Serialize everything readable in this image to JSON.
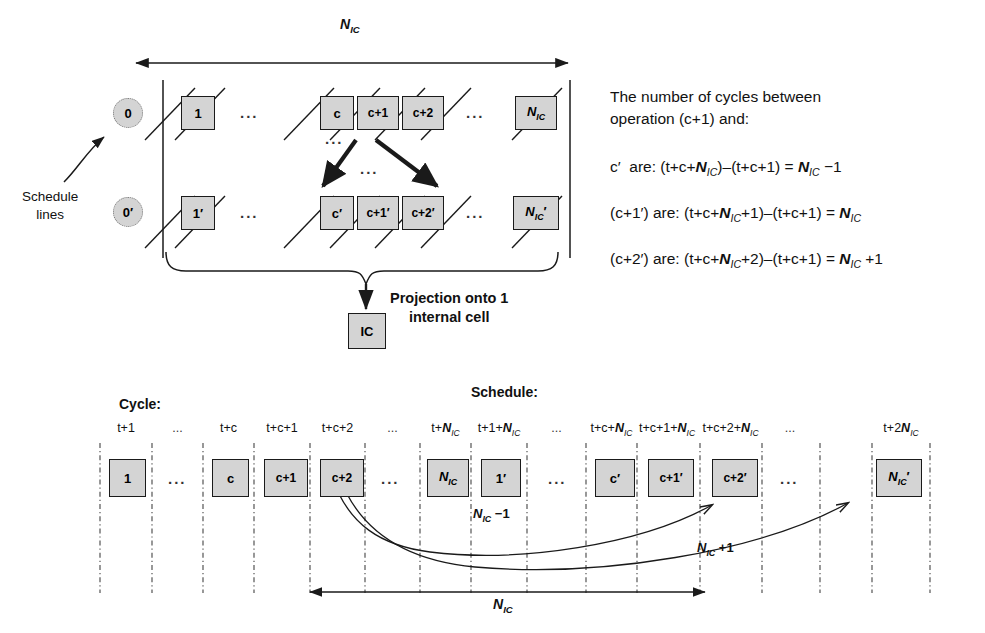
{
  "figure": {
    "top_panel": {
      "span_label": "N_IC",
      "schedule_lines_label": "Schedule\nlines",
      "row1": {
        "start_circle": "0",
        "boxes": [
          "1",
          "c",
          "c+1",
          "c+2",
          "N_IC"
        ],
        "ellipses": [
          "...",
          "...",
          "..."
        ]
      },
      "row2": {
        "start_circle": "0′",
        "boxes": [
          "1′",
          "c′",
          "c+1′",
          "c+2′",
          "N_IC′"
        ],
        "ellipses": [
          "...",
          "..."
        ]
      },
      "projection_label_line1": "Projection onto 1",
      "projection_label_line2": "internal cell",
      "internal_cell_box": "IC"
    },
    "equations": {
      "intro_line1": "The number of cycles between",
      "intro_line2": "operation (c+1) and:",
      "items": [
        "c′  are: (t+c+N_IC)–(t+c+1) = N_IC −1",
        "(c+1′) are: (t+c+N_IC+1)–(t+c+1) = N_IC",
        "(c+2′) are: (t+c+N_IC+2)–(t+c+1) = N_IC +1"
      ]
    },
    "timeline": {
      "cycle_header": "Cycle:",
      "schedule_header": "Schedule:",
      "ticks": [
        "t+1",
        "...",
        "t+c",
        "t+c+1",
        "t+c+2",
        "...",
        "t+N_IC",
        "t+1+N_IC",
        "...",
        "t+c+N_IC",
        "t+c+1+N_IC",
        "t+c+2+N_IC",
        "...",
        "t+2N_IC"
      ],
      "boxes": [
        "1",
        "...",
        "c",
        "c+1",
        "c+2",
        "...",
        "N_IC",
        "1′",
        "...",
        "c′",
        "c+1′",
        "c+2′",
        "...",
        "N_IC′"
      ],
      "annotation_minus": "N_IC −1",
      "annotation_plus": "N_IC +1",
      "span_label": "N_IC"
    }
  },
  "colors": {
    "box_fill": "#d4d4d4",
    "stroke": "#1a1a1a",
    "grid": "#555555",
    "background": "#ffffff"
  }
}
